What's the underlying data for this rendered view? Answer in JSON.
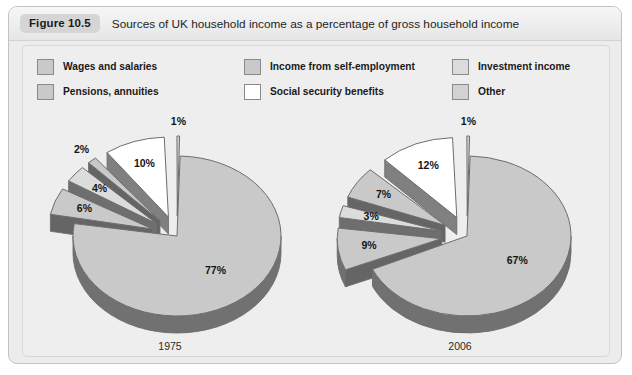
{
  "figure": {
    "badge": "Figure 10.5",
    "title": "Sources of UK household income as a percentage of gross household income"
  },
  "legend": {
    "items": [
      {
        "label": "Wages and salaries",
        "color": "#c9c9c9",
        "key": "wages"
      },
      {
        "label": "Income from self-employment",
        "color": "#c9c9c9",
        "key": "self_employment"
      },
      {
        "label": "Investment income",
        "color": "#dcdcdc",
        "key": "investment"
      },
      {
        "label": "Pensions, annuities",
        "color": "#c9c9c9",
        "key": "pensions"
      },
      {
        "label": "Social security benefits",
        "color": "#ffffff",
        "key": "social_security"
      },
      {
        "label": "Other",
        "color": "#d2d2d2",
        "key": "other"
      }
    ]
  },
  "chart_data": {
    "type": "pie",
    "title": "Sources of UK household income as a percentage of gross household income",
    "value_suffix": "%",
    "exploded": true,
    "three_d": true,
    "legend_position": "top",
    "categories": [
      "Wages and salaries",
      "Income from self-employment",
      "Investment income",
      "Pensions, annuities",
      "Social security benefits",
      "Other"
    ],
    "charts": [
      {
        "name": "1975",
        "year_label": "1975",
        "values": [
          77,
          6,
          4,
          2,
          10,
          1
        ],
        "labels": [
          "77%",
          "6%",
          "4%",
          "2%",
          "10%",
          "1%"
        ]
      },
      {
        "name": "2006",
        "year_label": "2006",
        "values": [
          67,
          9,
          3,
          7,
          12,
          1
        ],
        "labels": [
          "67%",
          "9%",
          "3%",
          "7%",
          "12%",
          "1%"
        ]
      }
    ]
  },
  "colors": {
    "slice_wages": "#c9c9c9",
    "slice_self_employment": "#c9c9c9",
    "slice_investment": "#dcdcdc",
    "slice_pensions": "#c9c9c9",
    "slice_social_security": "#ffffff",
    "slice_other": "#d2d2d2",
    "slice_edge": "#6d6d6d",
    "panel_bg": "#eeeeee",
    "card_bg": "#ececec"
  }
}
